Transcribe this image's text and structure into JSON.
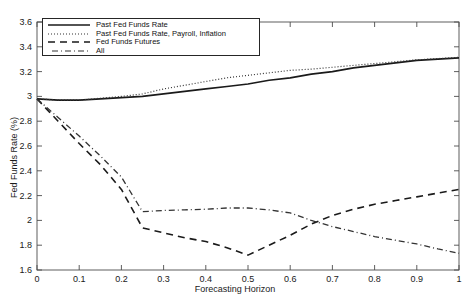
{
  "chart_data": {
    "type": "line",
    "title": "",
    "xlabel": "Forecasting Horizon",
    "ylabel": "Fed Funds Rate (%)",
    "xlim": [
      0,
      1
    ],
    "ylim": [
      1.6,
      3.6
    ],
    "xticks": [
      "0",
      "0.1",
      "0.2",
      "0.3",
      "0.4",
      "0.5",
      "0.6",
      "0.7",
      "0.8",
      "0.9",
      "1"
    ],
    "xtick_values": [
      0,
      0.1,
      0.2,
      0.3,
      0.4,
      0.5,
      0.6,
      0.7,
      0.8,
      0.9,
      1
    ],
    "yticks": [
      "1.6",
      "1.8",
      "2",
      "2.2",
      "2.4",
      "2.6",
      "2.8",
      "3",
      "3.2",
      "3.4",
      "3.6"
    ],
    "ytick_values": [
      1.6,
      1.8,
      2.0,
      2.2,
      2.4,
      2.6,
      2.8,
      3.0,
      3.2,
      3.4,
      3.6
    ],
    "grid": false,
    "legend_position": "top-left",
    "x": [
      0,
      0.05,
      0.1,
      0.15,
      0.2,
      0.25,
      0.3,
      0.35,
      0.4,
      0.45,
      0.5,
      0.55,
      0.6,
      0.65,
      0.7,
      0.75,
      0.8,
      0.85,
      0.9,
      0.95,
      1.0
    ],
    "series": [
      {
        "name": "Past Fed Funds Rate",
        "style": "solid",
        "color": "#1a1a1a",
        "values": [
          2.98,
          2.97,
          2.97,
          2.98,
          2.99,
          3.0,
          3.02,
          3.04,
          3.06,
          3.08,
          3.1,
          3.13,
          3.15,
          3.18,
          3.2,
          3.23,
          3.25,
          3.27,
          3.29,
          3.3,
          3.31
        ]
      },
      {
        "name": "Past Fed Funds Rate, Payroll, Inflation",
        "style": "dotted",
        "color": "#333333",
        "values": [
          2.98,
          2.97,
          2.97,
          2.985,
          3.0,
          3.02,
          3.06,
          3.09,
          3.12,
          3.15,
          3.17,
          3.19,
          3.21,
          3.22,
          3.235,
          3.25,
          3.265,
          3.28,
          3.295,
          3.305,
          3.315
        ]
      },
      {
        "name": "Fed Funds Futures",
        "style": "dashed",
        "color": "#1a1a1a",
        "values": [
          2.98,
          2.8,
          2.62,
          2.45,
          2.25,
          1.94,
          1.9,
          1.86,
          1.83,
          1.78,
          1.72,
          1.8,
          1.88,
          1.97,
          2.04,
          2.09,
          2.13,
          2.16,
          2.19,
          2.22,
          2.25
        ]
      },
      {
        "name": "All",
        "style": "dashdot",
        "color": "#333333",
        "values": [
          2.98,
          2.83,
          2.68,
          2.52,
          2.35,
          2.07,
          2.08,
          2.085,
          2.09,
          2.1,
          2.1,
          2.085,
          2.06,
          2.0,
          1.95,
          1.91,
          1.87,
          1.84,
          1.81,
          1.77,
          1.735
        ]
      }
    ]
  },
  "legend": {
    "items": [
      {
        "label": "Past Fed Funds Rate",
        "style": "solid"
      },
      {
        "label": "Past Fed Funds Rate, Payroll, Inflation",
        "style": "dotted"
      },
      {
        "label": "Fed Funds Futures",
        "style": "dashed"
      },
      {
        "label": "All",
        "style": "dashdot"
      }
    ]
  }
}
